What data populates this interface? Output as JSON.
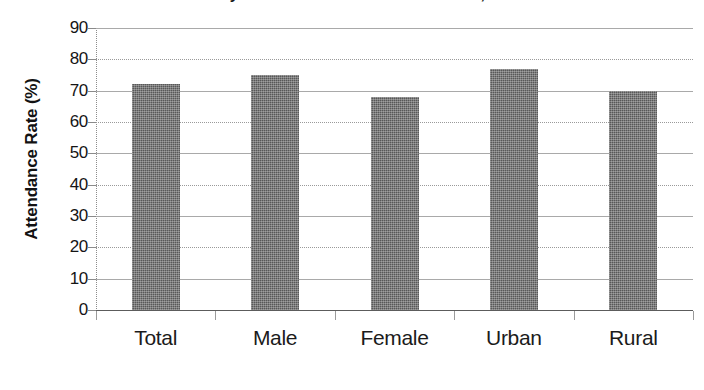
{
  "chart_data": {
    "type": "bar",
    "title": "Primary School Attendance Rate in India, 2006",
    "xlabel": "",
    "ylabel": "Attendance Rate (%)",
    "categories": [
      "Total",
      "Male",
      "Female",
      "Urban",
      "Rural"
    ],
    "values": [
      72,
      75,
      68,
      77,
      70
    ],
    "series": [
      {
        "name": "Attendance Rate",
        "values": [
          72,
          75,
          68,
          77,
          70
        ],
        "color": "#585858"
      }
    ],
    "ylim": [
      0,
      90
    ],
    "ytick_labels": [
      "90",
      "80",
      "70",
      "60",
      "50",
      "40",
      "30",
      "20",
      "10",
      "0"
    ],
    "ytick_values": [
      90,
      80,
      70,
      60,
      50,
      40,
      30,
      20,
      10,
      0
    ],
    "grid": true,
    "legend": "none"
  },
  "colors": {
    "bar_fill": "#585858",
    "gridline": "#a9a9a9",
    "axis": "#5c5c5c",
    "text": "#151515",
    "background": "#ffffff"
  }
}
